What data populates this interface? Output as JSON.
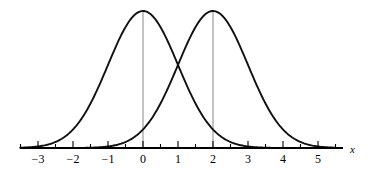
{
  "figure": {
    "title": "",
    "axis_label_x": "x",
    "background_color": "#ffffff",
    "curve_color": "#111111",
    "axis_color": "#000000",
    "guide_color": "#7a7a7a"
  },
  "axis": {
    "tick_labels": [
      "−3",
      "−2",
      "−1",
      "0",
      "1",
      "2",
      "3",
      "4",
      "5"
    ]
  },
  "chart_data": {
    "type": "line",
    "title": "",
    "xlabel": "x",
    "ylabel": "",
    "xlim": [
      -3.5,
      5.5
    ],
    "ylim": [
      0,
      0.42
    ],
    "grid": false,
    "legend": "none",
    "xticks": [
      -3,
      -2,
      -1,
      0,
      1,
      2,
      3,
      4,
      5
    ],
    "xtick_labels": [
      "−3",
      "−2",
      "−1",
      "0",
      "1",
      "2",
      "3",
      "4",
      "5"
    ],
    "yticks": [],
    "annotations": [
      {
        "text": "x",
        "x": 5.6,
        "y": 0.0,
        "style": "italic"
      }
    ],
    "series": [
      {
        "name": "normal mean 0",
        "type": "gaussian",
        "mu": 0,
        "sigma": 1,
        "peak_x": 0,
        "peak_y": 0.3989,
        "x": [
          -3.5,
          -3.0,
          -2.5,
          -2.0,
          -1.5,
          -1.0,
          -0.5,
          0.0,
          0.5,
          1.0,
          1.5,
          2.0,
          2.5,
          3.0,
          3.5
        ],
        "values": [
          0.0009,
          0.0044,
          0.0175,
          0.054,
          0.1295,
          0.242,
          0.3521,
          0.3989,
          0.3521,
          0.242,
          0.1295,
          0.054,
          0.0175,
          0.0044,
          0.0009
        ]
      },
      {
        "name": "normal mean 2",
        "type": "gaussian",
        "mu": 2,
        "sigma": 1,
        "peak_x": 2,
        "peak_y": 0.3989,
        "x": [
          -1.5,
          -1.0,
          -0.5,
          0.0,
          0.5,
          1.0,
          1.5,
          2.0,
          2.5,
          3.0,
          3.5,
          4.0,
          4.5,
          5.0,
          5.5
        ],
        "values": [
          0.0009,
          0.0044,
          0.0175,
          0.054,
          0.1295,
          0.242,
          0.3521,
          0.3989,
          0.3521,
          0.242,
          0.1295,
          0.054,
          0.0175,
          0.0044,
          0.0009
        ]
      }
    ],
    "intersection": {
      "x": 1,
      "y": 0.242
    },
    "guide_lines": [
      {
        "x": 0,
        "from_y": 0,
        "to_y": 0.3989
      },
      {
        "x": 2,
        "from_y": 0,
        "to_y": 0.3989
      }
    ]
  }
}
